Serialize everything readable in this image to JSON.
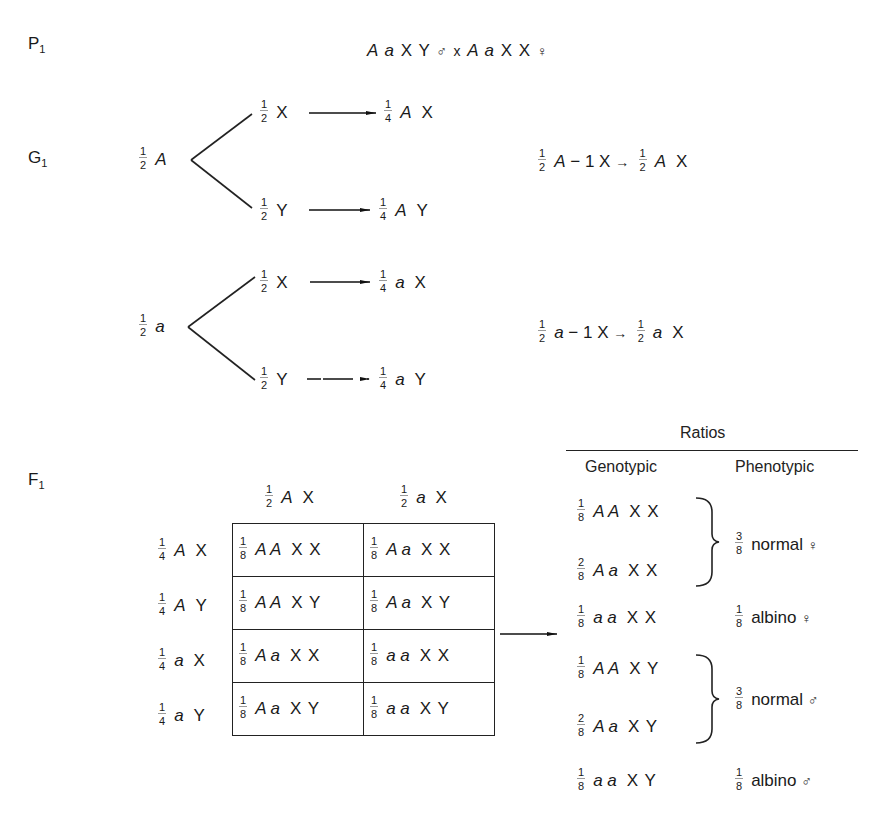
{
  "labels": {
    "parental": "P",
    "parental_sub": "1",
    "gametes": "G",
    "gametes_sub": "1",
    "filial": "F",
    "filial_sub": "1"
  },
  "parental_cross": {
    "male_genotype_allele": "A a",
    "male_sex_chromosomes": "X Y",
    "male_symbol": "♂",
    "cross_symbol": "x",
    "female_genotype_allele": "A a",
    "female_sex_chromosomes": "X X",
    "female_symbol": "♀"
  },
  "male_gametes": [
    {
      "allele_frac": {
        "n": "1",
        "d": "2"
      },
      "allele": "A",
      "branches": [
        {
          "frac": {
            "n": "1",
            "d": "2"
          },
          "chrom": "X",
          "result_frac": {
            "n": "1",
            "d": "4"
          },
          "result_allele": "A",
          "result_chrom": "X"
        },
        {
          "frac": {
            "n": "1",
            "d": "2"
          },
          "chrom": "Y",
          "result_frac": {
            "n": "1",
            "d": "4"
          },
          "result_allele": "A",
          "result_chrom": "Y"
        }
      ]
    },
    {
      "allele_frac": {
        "n": "1",
        "d": "2"
      },
      "allele": "a",
      "branches": [
        {
          "frac": {
            "n": "1",
            "d": "2"
          },
          "chrom": "X",
          "result_frac": {
            "n": "1",
            "d": "4"
          },
          "result_allele": "a",
          "result_chrom": "X"
        },
        {
          "frac": {
            "n": "1",
            "d": "2"
          },
          "chrom": "Y",
          "result_frac": {
            "n": "1",
            "d": "4"
          },
          "result_allele": "a",
          "result_chrom": "Y"
        }
      ]
    }
  ],
  "female_gametes": [
    {
      "frac": {
        "n": "1",
        "d": "2"
      },
      "allele": "A",
      "dash": "−",
      "chrom_count": "1",
      "chrom": "X",
      "arrow": "→",
      "result_frac": {
        "n": "1",
        "d": "2"
      },
      "result_allele": "A",
      "result_chrom": "X"
    },
    {
      "frac": {
        "n": "1",
        "d": "2"
      },
      "allele": "a",
      "dash": "−",
      "chrom_count": "1",
      "chrom": "X",
      "arrow": "→",
      "result_frac": {
        "n": "1",
        "d": "2"
      },
      "result_allele": "a",
      "result_chrom": "X"
    }
  ],
  "punnett": {
    "col_headers": [
      {
        "frac": {
          "n": "1",
          "d": "2"
        },
        "allele": "A",
        "chrom": "X"
      },
      {
        "frac": {
          "n": "1",
          "d": "2"
        },
        "allele": "a",
        "chrom": "X"
      }
    ],
    "row_headers": [
      {
        "frac": {
          "n": "1",
          "d": "4"
        },
        "allele": "A",
        "chrom": "X"
      },
      {
        "frac": {
          "n": "1",
          "d": "4"
        },
        "allele": "A",
        "chrom": "Y"
      },
      {
        "frac": {
          "n": "1",
          "d": "4"
        },
        "allele": "a",
        "chrom": "X"
      },
      {
        "frac": {
          "n": "1",
          "d": "4"
        },
        "allele": "a",
        "chrom": "Y"
      }
    ],
    "cells": [
      [
        {
          "frac": {
            "n": "1",
            "d": "8"
          },
          "alleles": "A A",
          "chroms": "X X"
        },
        {
          "frac": {
            "n": "1",
            "d": "8"
          },
          "alleles": "A a",
          "chroms": "X X"
        }
      ],
      [
        {
          "frac": {
            "n": "1",
            "d": "8"
          },
          "alleles": "A A",
          "chroms": "X Y"
        },
        {
          "frac": {
            "n": "1",
            "d": "8"
          },
          "alleles": "A a",
          "chroms": "X Y"
        }
      ],
      [
        {
          "frac": {
            "n": "1",
            "d": "8"
          },
          "alleles": "A a",
          "chroms": "X X"
        },
        {
          "frac": {
            "n": "1",
            "d": "8"
          },
          "alleles": "a a",
          "chroms": "X X"
        }
      ],
      [
        {
          "frac": {
            "n": "1",
            "d": "8"
          },
          "alleles": "A a",
          "chroms": "X Y"
        },
        {
          "frac": {
            "n": "1",
            "d": "8"
          },
          "alleles": "a a",
          "chroms": "X Y"
        }
      ]
    ]
  },
  "ratios": {
    "title": "Ratios",
    "genotypic_header": "Genotypic",
    "phenotypic_header": "Phenotypic",
    "genotypic": [
      {
        "frac": {
          "n": "1",
          "d": "8"
        },
        "alleles": "A A",
        "chroms": "X X"
      },
      {
        "frac": {
          "n": "2",
          "d": "8"
        },
        "alleles": "A a",
        "chroms": "X X"
      },
      {
        "frac": {
          "n": "1",
          "d": "8"
        },
        "alleles": "a a",
        "chroms": "X X"
      },
      {
        "frac": {
          "n": "1",
          "d": "8"
        },
        "alleles": "A A",
        "chroms": "X Y"
      },
      {
        "frac": {
          "n": "2",
          "d": "8"
        },
        "alleles": "A a",
        "chroms": "X Y"
      },
      {
        "frac": {
          "n": "1",
          "d": "8"
        },
        "alleles": "a a",
        "chroms": "X Y"
      }
    ],
    "phenotypic": [
      {
        "frac": {
          "n": "3",
          "d": "8"
        },
        "label": "normal",
        "sex": "♀"
      },
      {
        "frac": {
          "n": "1",
          "d": "8"
        },
        "label": "albino",
        "sex": "♀"
      },
      {
        "frac": {
          "n": "3",
          "d": "8"
        },
        "label": "normal",
        "sex": "♂"
      },
      {
        "frac": {
          "n": "1",
          "d": "8"
        },
        "label": "albino",
        "sex": "♂"
      }
    ]
  }
}
